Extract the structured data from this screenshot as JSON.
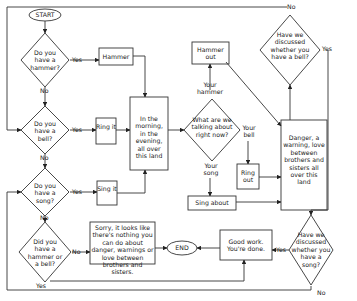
{
  "nodes": {
    "start": "START",
    "end": "END",
    "q_hammer": "Do you have a hammer?",
    "q_bell": "Do you have a bell?",
    "q_song": "Do you have a song?",
    "q_hammer_or_bell": "Did you have a hammer or a bell?",
    "hammer": "Hammer",
    "ring_it": "Ring it",
    "sing_it": "Sing it",
    "morning": "In the morning, in the evening, all over this land",
    "q_talking": "What are we talking about right now?",
    "hammer_out": "Hammer out",
    "ring_out": "Ring out",
    "sing_about": "Sing about",
    "danger": "Danger, a warning, love between brothers and sisters all over this land",
    "q_discussed_bell": "Have we discussed whether you have a bell?",
    "q_discussed_song": "Have we discussed whether you have a song?",
    "sorry": "Sorry, it looks like there's nothing you can do about danger, warnings or love between brothers and sisters.",
    "good_work": "Good work. You're done."
  },
  "labels": {
    "yes": "Yes",
    "no": "No",
    "your_hammer": "Your hammer",
    "your_bell": "Your bell",
    "your_song": "Your song"
  }
}
